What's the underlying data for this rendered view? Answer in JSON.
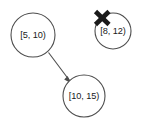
{
  "diagram": {
    "background_color": "#ffffff",
    "stroke_color": "#4d4d4d",
    "text_color": "#1a1a1a",
    "cross_color": "#1a1a1a",
    "nodes": [
      {
        "id": "node-interval-5-10",
        "label": "[5, 10)",
        "cx": 33,
        "cy": 35,
        "r": 22,
        "crossed_out": false
      },
      {
        "id": "node-interval-8-12",
        "label": "[8, 12)",
        "cx": 113,
        "cy": 31,
        "r": 18,
        "crossed_out": true
      },
      {
        "id": "node-interval-10-15",
        "label": "[10, 15)",
        "cx": 84,
        "cy": 96,
        "r": 21,
        "crossed_out": false
      }
    ],
    "edges": [
      {
        "id": "edge-5-10-to-10-15",
        "from": "node-interval-5-10",
        "to": "node-interval-10-15",
        "directed": true
      }
    ],
    "cross": {
      "label": "x-mark",
      "cx": 102,
      "cy": 18,
      "size": 11
    }
  }
}
